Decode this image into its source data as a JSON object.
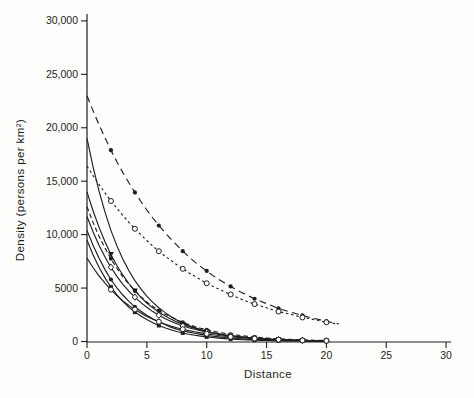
{
  "figure": {
    "background": "#fdfdfb",
    "ink": "#1f1f1f"
  },
  "chart_data": {
    "type": "line",
    "title": "",
    "xlabel": "Distance",
    "ylabel": "Density (persons per km²)",
    "xlim": [
      0,
      30
    ],
    "ylim": [
      0,
      30000
    ],
    "grid": false,
    "legend": "none",
    "x_ticks": [
      0,
      5,
      10,
      15,
      20,
      25,
      30
    ],
    "x_tick_labels": [
      "0",
      "5",
      "10",
      "15",
      "20",
      "25",
      "30"
    ],
    "y_ticks": [
      0,
      5000,
      10000,
      15000,
      20000,
      25000,
      30000
    ],
    "y_tick_labels": [
      "0",
      "5000",
      "10,000",
      "15,000",
      "20,000",
      "25,000",
      "30,000"
    ],
    "x_start": 0,
    "x_step": 1,
    "marker_xs": [
      2,
      4,
      6,
      8,
      10,
      12,
      14,
      16,
      18,
      20
    ],
    "series": [
      {
        "name": "curve-1",
        "line": "dash-long",
        "marker": "filled-circle",
        "values": [
          23000,
          20300,
          17900,
          15800,
          13950,
          12300,
          10850,
          9600,
          8450,
          7450,
          6600,
          5800,
          5150,
          4550,
          4000,
          3550,
          3100,
          2750,
          2450,
          2150,
          1900,
          1670
        ]
      },
      {
        "name": "curve-2",
        "line": "dash-short",
        "marker": "open-circle",
        "values": [
          16400,
          14700,
          13150,
          11800,
          10550,
          9450,
          8450,
          7600,
          6800,
          6100,
          5450,
          4900,
          4400,
          3900,
          3500,
          3150,
          2800,
          2550,
          2250,
          2050,
          1800,
          1630
        ]
      },
      {
        "name": "curve-3",
        "line": "solid",
        "marker": "none",
        "values": [
          19000,
          14100,
          10400,
          7700,
          5700,
          4250,
          3150,
          2350,
          1700,
          1300,
          950,
          700,
          520,
          390,
          290,
          210,
          160,
          120,
          90,
          65,
          50
        ]
      },
      {
        "name": "curve-4",
        "line": "solid",
        "marker": "filled-triangle",
        "values": [
          14000,
          10700,
          8150,
          6200,
          4750,
          3600,
          2750,
          2100,
          1600,
          1250,
          950,
          720,
          550,
          420,
          320,
          240,
          185,
          140,
          110,
          80,
          65
        ]
      },
      {
        "name": "curve-5",
        "line": "dash-med",
        "marker": "filled-circle",
        "values": [
          12600,
          9850,
          7750,
          6050,
          4750,
          3700,
          2900,
          2300,
          1800,
          1400,
          1100,
          860,
          670,
          530,
          410,
          320,
          250,
          200,
          155,
          120,
          95
        ]
      },
      {
        "name": "curve-6",
        "line": "solid",
        "marker": "open-diamond",
        "values": [
          11700,
          9000,
          6950,
          5350,
          4150,
          3200,
          2450,
          1900,
          1450,
          1150,
          870,
          670,
          520,
          400,
          310,
          240,
          185,
          140,
          110,
          85,
          65
        ]
      },
      {
        "name": "curve-7",
        "line": "solid",
        "marker": "filled-circle",
        "values": [
          10400,
          7800,
          5800,
          4350,
          3250,
          2450,
          1850,
          1350,
          1000,
          770,
          570,
          430,
          320,
          240,
          180,
          135,
          100,
          75,
          55,
          42,
          32
        ]
      },
      {
        "name": "curve-8",
        "line": "solid",
        "marker": "filled-square",
        "values": [
          9500,
          6950,
          5100,
          3750,
          2750,
          2050,
          1500,
          1100,
          800,
          590,
          430,
          320,
          230,
          170,
          125,
          90,
          65,
          50,
          36,
          27,
          20
        ]
      },
      {
        "name": "curve-9",
        "line": "solid",
        "marker": "open-circle",
        "values": [
          7800,
          6150,
          4850,
          3800,
          3000,
          2350,
          1850,
          1450,
          1150,
          910,
          715,
          560,
          440,
          350,
          275,
          215,
          170,
          135,
          105,
          82,
          65
        ]
      }
    ]
  }
}
